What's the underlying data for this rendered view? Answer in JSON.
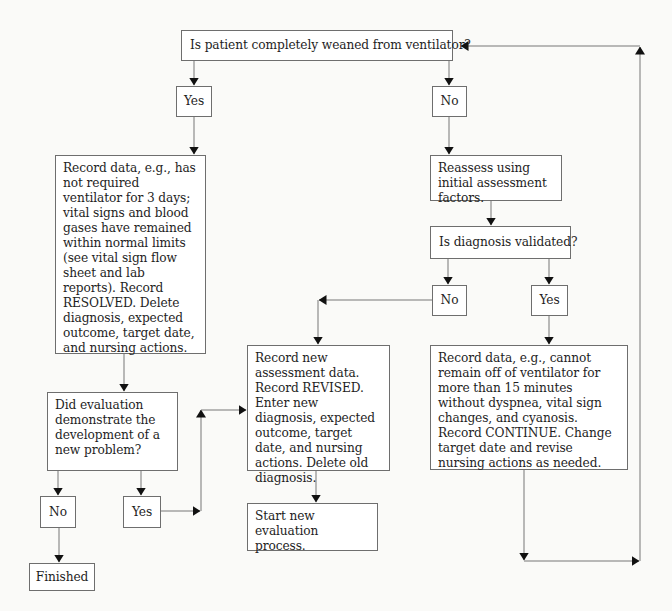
{
  "diagram": {
    "type": "flowchart",
    "nodes": {
      "weaned_question": "Is patient completely weaned from ventilator?",
      "weaned_yes": "Yes",
      "weaned_no": "No",
      "resolved_record": "Record data, e.g., has not required ventilator for 3 days; vital signs and blood gases have remained within normal limits (see vital sign flow sheet and lab reports). Record RESOLVED. Delete diagnosis, expected outcome, target date, and nursing actions.",
      "reassess": "Reassess using initial assessment factors.",
      "diagnosis_validated_question": "Is diagnosis validated?",
      "validated_no": "No",
      "validated_yes": "Yes",
      "revised_record": "Record new assessment data. Record REVISED. Enter new diagnosis, expected outcome, target date, and nursing actions. Delete old diagnosis.",
      "continue_record": "Record data, e.g., cannot remain off of ventilator for more than 15 minutes without dyspnea, vital sign changes, and cyanosis. Record CONTINUE. Change target date and revise nursing actions as needed.",
      "new_problem_question": "Did evaluation demonstrate the development of a new problem?",
      "new_problem_no": "No",
      "new_problem_yes": "Yes",
      "finished": "Finished",
      "start_new_evaluation": "Start new evaluation process."
    },
    "edges": [
      {
        "from": "weaned_question",
        "to": "weaned_yes"
      },
      {
        "from": "weaned_question",
        "to": "weaned_no"
      },
      {
        "from": "weaned_yes",
        "to": "resolved_record"
      },
      {
        "from": "weaned_no",
        "to": "reassess"
      },
      {
        "from": "reassess",
        "to": "diagnosis_validated_question"
      },
      {
        "from": "diagnosis_validated_question",
        "to": "validated_no"
      },
      {
        "from": "diagnosis_validated_question",
        "to": "validated_yes"
      },
      {
        "from": "validated_no",
        "to": "revised_record"
      },
      {
        "from": "validated_yes",
        "to": "continue_record"
      },
      {
        "from": "continue_record",
        "to": "weaned_question"
      },
      {
        "from": "resolved_record",
        "to": "new_problem_question"
      },
      {
        "from": "new_problem_question",
        "to": "new_problem_no"
      },
      {
        "from": "new_problem_question",
        "to": "new_problem_yes"
      },
      {
        "from": "new_problem_no",
        "to": "finished"
      },
      {
        "from": "new_problem_yes",
        "to": "revised_record"
      },
      {
        "from": "revised_record",
        "to": "start_new_evaluation"
      }
    ]
  }
}
